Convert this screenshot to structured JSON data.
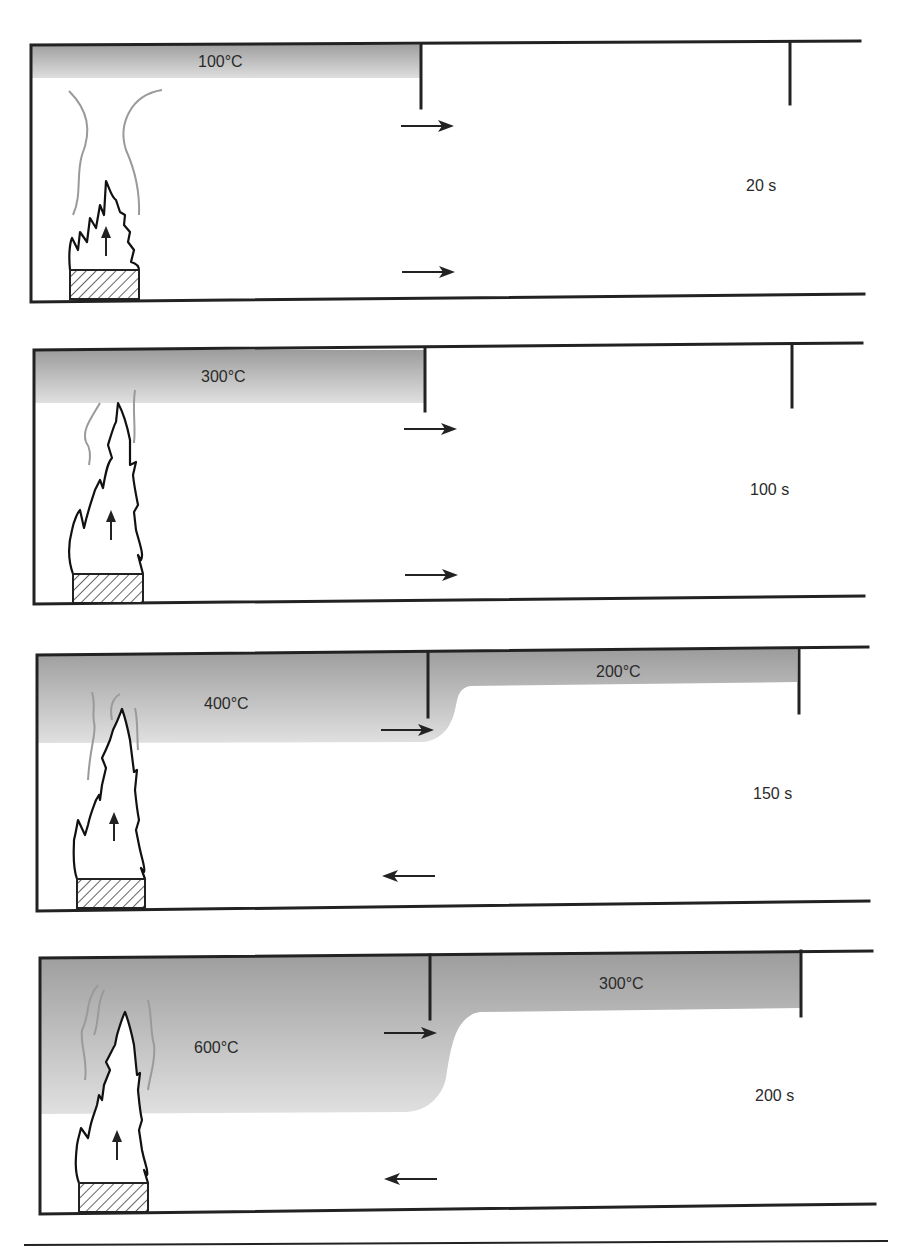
{
  "figure": {
    "colors": {
      "line": "#222222",
      "smoke_top": "#9c9c9c",
      "smoke_bottom": "#dcdcdc",
      "plume": "#9a9a9a",
      "background": "#ffffff"
    },
    "panels": [
      {
        "time_label": "20 s",
        "room_layer_temp": "100°C",
        "corridor_layer_temp": null,
        "upper_flow_direction": "right",
        "lower_flow_direction": "right"
      },
      {
        "time_label": "100 s",
        "room_layer_temp": "300°C",
        "corridor_layer_temp": null,
        "upper_flow_direction": "right",
        "lower_flow_direction": "right"
      },
      {
        "time_label": "150 s",
        "room_layer_temp": "400°C",
        "corridor_layer_temp": "200°C",
        "upper_flow_direction": "right",
        "lower_flow_direction": "left"
      },
      {
        "time_label": "200 s",
        "room_layer_temp": "600°C",
        "corridor_layer_temp": "300°C",
        "upper_flow_direction": "right",
        "lower_flow_direction": "left"
      }
    ],
    "icons": {
      "fuel": "hatched-fuel-bed-icon",
      "flame": "flame-icon",
      "up_arrow": "arrow-up-icon",
      "flow_arrow": "arrow-icon"
    }
  }
}
